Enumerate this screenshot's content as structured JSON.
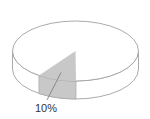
{
  "chart_data": {
    "type": "pie",
    "style": "3d",
    "title": "",
    "slices": [
      {
        "label": "10%",
        "value": 10,
        "highlighted": true,
        "color": "#c8c8c8"
      },
      {
        "label": "",
        "value": 90,
        "highlighted": false,
        "color": "#ffffff"
      }
    ],
    "legend": "none"
  },
  "colors": {
    "outline": "#a0a0a0",
    "highlight_fill": "#c8c8c8",
    "base_fill": "#ffffff",
    "label_text": "#333333"
  }
}
